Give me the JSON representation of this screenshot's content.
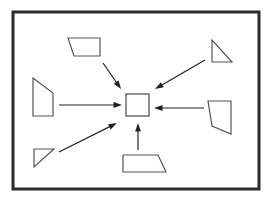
{
  "figure": {
    "title": "",
    "type": "diagram",
    "background_color": "#ffffff",
    "frame": {
      "name": "outer-frame",
      "x": 13,
      "y": 12,
      "width": 246,
      "height": 177,
      "stroke_color": "#2b2b2b",
      "stroke_width": 3,
      "fill": "#ffffff"
    },
    "center": {
      "name": "center-square",
      "shape": "square",
      "x": 126,
      "y": 94,
      "width": 23,
      "height": 22,
      "stroke_color": "#555555",
      "stroke_width": 1.3,
      "fill": "#ffffff",
      "label": ""
    },
    "shapes": [
      {
        "id": "top-left-trapezoid",
        "shape": "trapezoid",
        "label": "",
        "points": "68,38 100,38 100,56 74,56",
        "stroke_color": "#555555",
        "stroke_width": 1.2,
        "fill": "#ffffff"
      },
      {
        "id": "top-right-triangle",
        "shape": "right-triangle",
        "label": "",
        "points": "212,40 212,62 232,62",
        "stroke_color": "#555555",
        "stroke_width": 1.2,
        "fill": "#ffffff"
      },
      {
        "id": "left-quadrilateral",
        "shape": "quadrilateral",
        "label": "",
        "points": "33,78 53,93 53,116 33,116",
        "stroke_color": "#555555",
        "stroke_width": 1.2,
        "fill": "#ffffff"
      },
      {
        "id": "right-quadrilateral",
        "shape": "quadrilateral",
        "label": "",
        "points": "208,101 231,101 231,134 212,126",
        "stroke_color": "#555555",
        "stroke_width": 1.2,
        "fill": "#ffffff"
      },
      {
        "id": "bottom-trapezoid",
        "shape": "trapezoid",
        "label": "",
        "points": "123,155 158,155 166,172 123,172",
        "stroke_color": "#555555",
        "stroke_width": 1.2,
        "fill": "#ffffff"
      },
      {
        "id": "bottom-left-triangle",
        "shape": "right-triangle",
        "label": "",
        "points": "34,149 54,149 34,167",
        "stroke_color": "#555555",
        "stroke_width": 1.2,
        "fill": "#ffffff"
      }
    ],
    "arrows": [
      {
        "id": "arrow-from-top-left",
        "from": "top-left-trapezoid",
        "to": "center-square",
        "direction": "down-right",
        "x1": 103,
        "y1": 63,
        "x2": 121,
        "y2": 89,
        "stroke_color": "#222222",
        "stroke_width": 1.2,
        "head": "solid-triangle"
      },
      {
        "id": "arrow-from-top-right",
        "from": "top-right-triangle",
        "to": "center-square",
        "direction": "down-left",
        "x1": 205,
        "y1": 60,
        "x2": 155,
        "y2": 89,
        "stroke_color": "#222222",
        "stroke_width": 1.2,
        "head": "solid-triangle"
      },
      {
        "id": "arrow-from-left",
        "from": "left-quadrilateral",
        "to": "center-square",
        "direction": "right",
        "x1": 59,
        "y1": 105,
        "x2": 122,
        "y2": 105,
        "stroke_color": "#222222",
        "stroke_width": 1.2,
        "head": "solid-triangle"
      },
      {
        "id": "arrow-from-right",
        "from": "right-quadrilateral",
        "to": "center-square",
        "direction": "left",
        "x1": 204,
        "y1": 108,
        "x2": 154,
        "y2": 108,
        "stroke_color": "#222222",
        "stroke_width": 1.2,
        "head": "solid-triangle"
      },
      {
        "id": "arrow-from-bottom",
        "from": "bottom-trapezoid",
        "to": "center-square",
        "direction": "up",
        "x1": 138,
        "y1": 150,
        "x2": 138,
        "y2": 123,
        "stroke_color": "#222222",
        "stroke_width": 1.2,
        "head": "solid-triangle"
      },
      {
        "id": "arrow-from-bottom-left",
        "from": "bottom-left-triangle",
        "to": "center-square",
        "direction": "up-right",
        "x1": 59,
        "y1": 152,
        "x2": 117,
        "y2": 123,
        "stroke_color": "#222222",
        "stroke_width": 1.2,
        "head": "solid-triangle"
      }
    ]
  }
}
